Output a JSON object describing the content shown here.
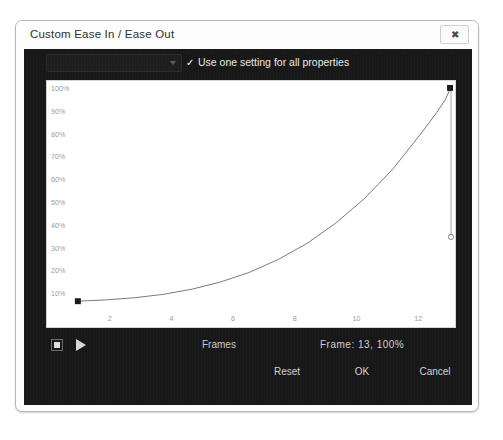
{
  "window": {
    "title": "Custom Ease In / Ease Out",
    "close_icon": "close-icon",
    "close_glyph": "✖"
  },
  "controls": {
    "property_select_value": "",
    "property_select_icon": "chevron-down-icon",
    "use_one_setting_label": "Use one setting for all properties",
    "use_one_setting_checked": true,
    "check_glyph": "✓"
  },
  "transport": {
    "stop_icon": "stop-icon",
    "play_icon": "play-icon",
    "frames_label": "Frames",
    "frame_readout": "Frame:  13,  100%"
  },
  "footer": {
    "reset_label": "Reset",
    "ok_label": "OK",
    "cancel_label": "Cancel"
  },
  "colors": {
    "dialog_bg": "#fdfdfd",
    "body_dark": "#171717",
    "plot_bg": "#ffffff",
    "curve": "#606060",
    "tick_text": "#9b9b9b",
    "label_text": "#e9e9e9"
  },
  "chart_data": {
    "type": "line",
    "title": "",
    "xlabel": "Frames",
    "ylabel": "",
    "xlim": [
      0,
      13
    ],
    "ylim": [
      0,
      100
    ],
    "grid": false,
    "legend": null,
    "x_ticks": [
      2,
      4,
      6,
      8,
      10,
      12
    ],
    "y_ticks": [
      10,
      20,
      30,
      40,
      50,
      60,
      70,
      80,
      90,
      100
    ],
    "y_tick_labels": [
      "10%",
      "20%",
      "30%",
      "40%",
      "50%",
      "60%",
      "70%",
      "80%",
      "90%",
      "100%"
    ],
    "x_tick_labels": [
      "2",
      "4",
      "6",
      "8",
      "10",
      "12"
    ],
    "series": [
      {
        "name": "ease",
        "x": [
          0,
          1,
          2,
          3,
          4,
          5,
          6,
          7,
          8,
          9,
          10,
          11,
          12,
          12.5,
          12.8,
          13
        ],
        "values": [
          0,
          0.6,
          1.6,
          3.2,
          5.6,
          9.0,
          13.5,
          19.5,
          27.0,
          36.5,
          48.0,
          62.0,
          79.0,
          88.0,
          94.0,
          100
        ]
      }
    ],
    "control_points": [
      {
        "name": "start-anchor",
        "x": 0,
        "y": 0
      },
      {
        "name": "end-anchor",
        "x": 13,
        "y": 100
      },
      {
        "name": "end-tangent-handle",
        "x": 13,
        "y": 30
      }
    ]
  }
}
